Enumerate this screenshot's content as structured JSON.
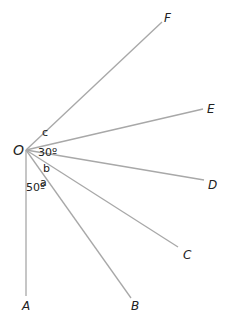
{
  "diagram": {
    "title": "",
    "origin": {
      "label": "O",
      "x": 26,
      "y": 150
    },
    "rays": [
      {
        "id": "F",
        "label": "F",
        "x2": 162,
        "y2": 22,
        "lx": 164,
        "ly": 22
      },
      {
        "id": "E",
        "label": "E",
        "x2": 203,
        "y2": 109,
        "lx": 207,
        "ly": 113
      },
      {
        "id": "D",
        "label": "D",
        "x2": 204,
        "y2": 180,
        "lx": 208,
        "ly": 189
      },
      {
        "id": "C",
        "label": "C",
        "x2": 178,
        "y2": 247,
        "lx": 183,
        "ly": 259
      },
      {
        "id": "B",
        "label": "B",
        "x2": 131,
        "y2": 298,
        "lx": 131,
        "ly": 310
      },
      {
        "id": "A",
        "label": "A",
        "x2": 26,
        "y2": 296,
        "lx": 22,
        "ly": 310
      }
    ],
    "angle_labels": [
      {
        "text": "c",
        "x": 42,
        "y": 136
      },
      {
        "text": "30º",
        "x": 38,
        "y": 156
      },
      {
        "text": "b",
        "x": 43,
        "y": 172
      },
      {
        "text": "a",
        "x": 40,
        "y": 186
      },
      {
        "text": "50º",
        "x": 26,
        "y": 191
      }
    ],
    "colors": {
      "line": "#a8a8a8",
      "text": "#222222"
    }
  }
}
